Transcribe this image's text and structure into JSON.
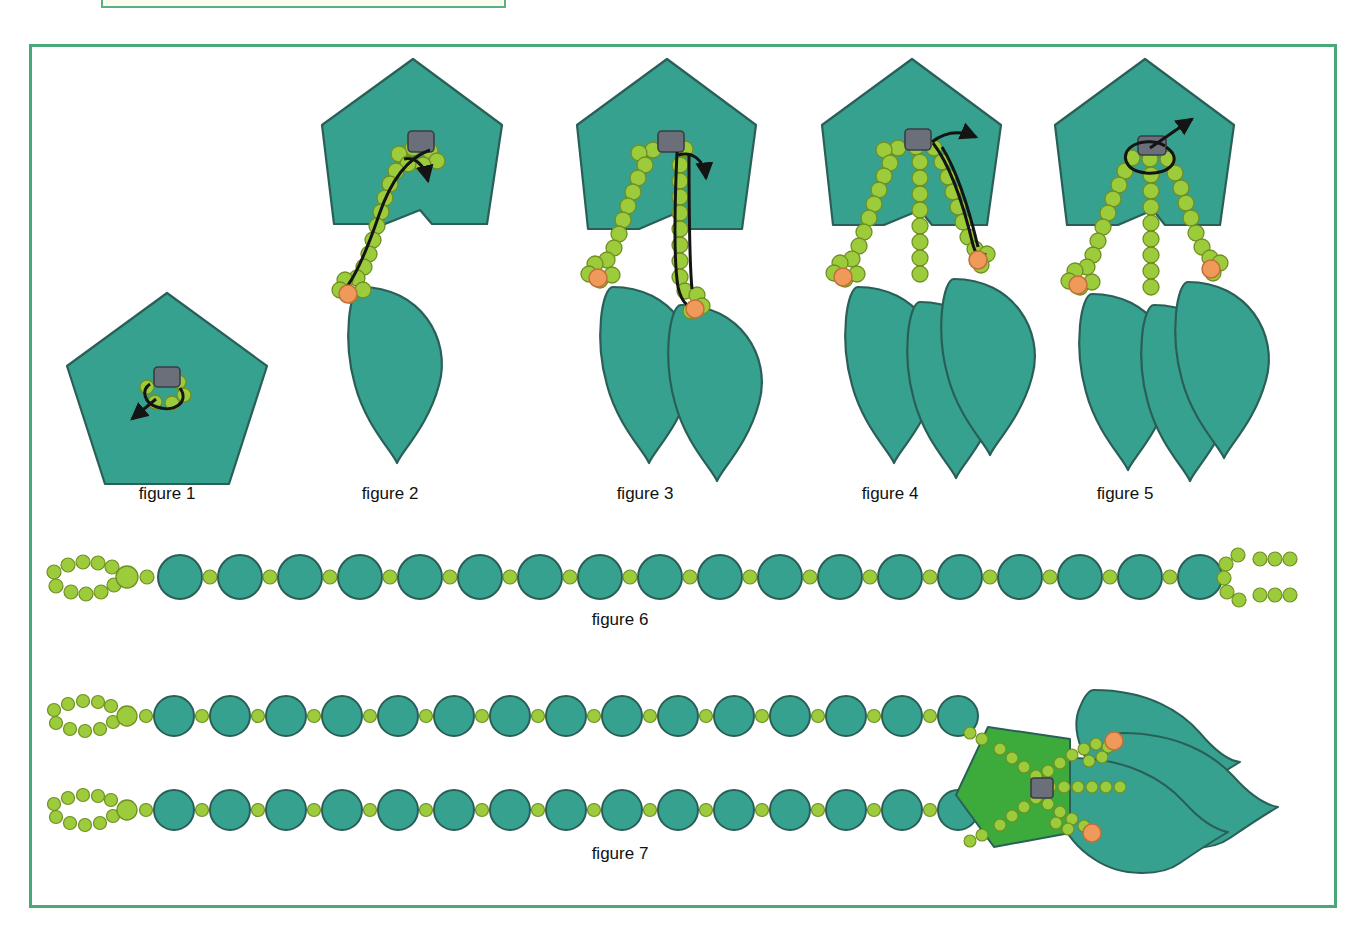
{
  "caption": {
    "text": "ASEXUALIS REALIBAT"
  },
  "panel": {
    "border_color": "#4aa777",
    "background": "#ffffff"
  },
  "palette": {
    "teal_body": "#37a18f",
    "teal_outline": "#2a5f57",
    "bright_green_pentagon": "#3cab3c",
    "bead_green": "#9ccb3b",
    "bead_green_outline": "#6f8f23",
    "bead_orange": "#ef9a5a",
    "bead_orange_outline": "#c2703a",
    "square_gray": "#6b6f7a",
    "square_gray_outline": "#3a3d45",
    "chain_black": "#141414",
    "caption_box_fill": "#fbfbf0",
    "caption_box_border": "#57b27f"
  },
  "figures": [
    {
      "id": "figure-1",
      "label": "figure 1",
      "label_x": 135,
      "label_y": 452,
      "description": "single pentagon cell with central gray square, small bead ring and short arrow"
    },
    {
      "id": "figure-2",
      "label": "figure 2",
      "label_x": 358,
      "label_y": 452,
      "description": "pentagon with one bead chain descending to an orange bead and one teal leaf"
    },
    {
      "id": "figure-3",
      "label": "figure 3",
      "label_x": 613,
      "label_y": 452,
      "description": "pentagon with two bead chains to two orange beads and two teal leaves"
    },
    {
      "id": "figure-4",
      "label": "figure 4",
      "label_x": 858,
      "label_y": 452,
      "description": "pentagon with three bead chains, arrow to the right, three teal leaves"
    },
    {
      "id": "figure-5",
      "label": "figure 5",
      "label_x": 1093,
      "label_y": 452,
      "description": "pentagon with looped chain around square, three bead chains, three teal leaves"
    },
    {
      "id": "figure-6",
      "label": "figure 6",
      "label_x": 613,
      "label_y": 572,
      "description": "single long horizontal chain of 23 large teal circles alternating with small green beads, bead loop at left end, forked beads at right end"
    },
    {
      "id": "figure-7",
      "label": "figure 7",
      "label_x": 613,
      "label_y": 808,
      "description": "two long horizontal chains of teal circles converging on a bright green pentagon with gray square, leading to orange beads and teal leaves"
    }
  ],
  "chain_counts": {
    "figure6_large_circles": 23,
    "figure7_upper_large_circles": 21,
    "figure7_lower_large_circles": 21
  }
}
